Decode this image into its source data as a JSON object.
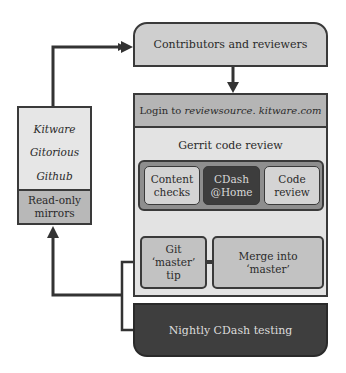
{
  "diagram": {
    "contributors": {
      "label": "Contributors and reviewers"
    },
    "gerrit": {
      "login_prefix": "Login to ",
      "login_host": "reviewsource. kitware.com",
      "title": "Gerrit code review",
      "checks": [
        {
          "line1": "Content",
          "line2": "checks"
        },
        {
          "line1": "CDash",
          "line2": "@Home"
        },
        {
          "line1": "Code",
          "line2": "review"
        }
      ],
      "git_tip": {
        "line1": "Git",
        "line2": "‘master’",
        "line3": "tip"
      },
      "merge": {
        "line1": "Merge into",
        "line2": "‘master’"
      }
    },
    "nightly": {
      "label": "Nightly CDash testing"
    },
    "mirrors": {
      "items": [
        "Kitware",
        "Gitorious",
        "Github"
      ],
      "label_line1": "Read-only",
      "label_line2": "mirrors"
    },
    "colors": {
      "line": "#333333",
      "light_fill": "#e3e3e3",
      "mid_fill": "#c2c2c2",
      "dark_fill": "#3e3e3e"
    }
  }
}
